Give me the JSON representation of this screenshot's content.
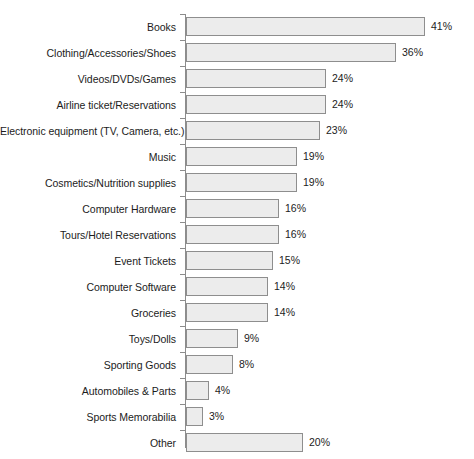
{
  "chart_data": {
    "type": "bar",
    "orientation": "horizontal",
    "title": "",
    "subtitle": "",
    "xlabel": "",
    "ylabel": "",
    "xlim": [
      0,
      41
    ],
    "grid": false,
    "legend": null,
    "value_suffix": "%",
    "categories": [
      "Books",
      "Clothing/Accessories/Shoes",
      "Videos/DVDs/Games",
      "Airline ticket/Reservations",
      "Electronic equipment (TV, Camera, etc.)",
      "Music",
      "Cosmetics/Nutrition supplies",
      "Computer Hardware",
      "Tours/Hotel Reservations",
      "Event Tickets",
      "Computer Software",
      "Groceries",
      "Toys/Dolls",
      "Sporting Goods",
      "Automobiles & Parts",
      "Sports Memorabilia",
      "Other"
    ],
    "values": [
      41,
      36,
      24,
      24,
      23,
      19,
      19,
      16,
      16,
      15,
      14,
      14,
      9,
      8,
      4,
      3,
      20
    ],
    "value_labels": [
      "41%",
      "36%",
      "24%",
      "24%",
      "23%",
      "19%",
      "19%",
      "16%",
      "16%",
      "15%",
      "14%",
      "14%",
      "9%",
      "8%",
      "4%",
      "3%",
      "20%"
    ],
    "colors": {
      "bar_fill": "#ececec",
      "bar_border": "#8e8e8e",
      "axis": "#8c8c8c",
      "text": "#1c1c1c",
      "background": "#ffffff"
    }
  }
}
